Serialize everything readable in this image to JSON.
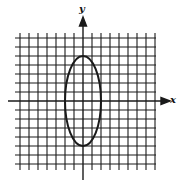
{
  "chart_data": {
    "type": "line",
    "title": "",
    "xlabel": "x",
    "ylabel": "y",
    "grid": true,
    "xlim": [
      -7,
      8
    ],
    "ylim": [
      -7,
      7
    ],
    "grid_spacing": 1,
    "axis_tick_labels": false,
    "series": [
      {
        "name": "ellipse",
        "shape": "ellipse",
        "center": [
          0,
          0
        ],
        "semi_axis_x": 2,
        "semi_axis_y": 5,
        "equation": "x^2/4 + y^2/25 = 1"
      }
    ]
  },
  "labels": {
    "x_axis": "x",
    "y_axis": "y"
  },
  "colors": {
    "ink": "#1a1a1a",
    "background": "#ffffff"
  }
}
